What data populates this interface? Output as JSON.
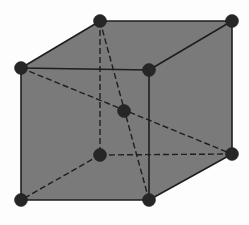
{
  "diagram": {
    "colors": {
      "fill": "#7a7a7a",
      "edge": "#1e1e1e",
      "atom": "#262626",
      "background": "#fdfdfd"
    },
    "atom_radius": 6.5,
    "vertices": {
      "top_back_left": {
        "x": 100,
        "y": 21
      },
      "top_back_right": {
        "x": 232,
        "y": 21
      },
      "top_front_left": {
        "x": 21,
        "y": 68
      },
      "top_front_right": {
        "x": 149,
        "y": 70
      },
      "bottom_back_left": {
        "x": 100,
        "y": 155
      },
      "bottom_back_right": {
        "x": 232,
        "y": 154
      },
      "bottom_front_left": {
        "x": 21,
        "y": 200
      },
      "bottom_front_right": {
        "x": 149,
        "y": 200
      },
      "body_center": {
        "x": 124,
        "y": 111
      }
    },
    "visible_edges": [
      [
        "top_front_left",
        "top_back_left"
      ],
      [
        "top_back_left",
        "top_back_right"
      ],
      [
        "top_back_right",
        "top_front_right"
      ],
      [
        "top_front_right",
        "top_front_left"
      ],
      [
        "top_front_left",
        "bottom_front_left"
      ],
      [
        "top_front_right",
        "bottom_front_right"
      ],
      [
        "top_back_right",
        "bottom_back_right"
      ],
      [
        "bottom_front_left",
        "bottom_front_right"
      ],
      [
        "bottom_front_right",
        "bottom_back_right"
      ]
    ],
    "hidden_edges": [
      [
        "top_back_left",
        "bottom_back_left"
      ],
      [
        "bottom_back_left",
        "bottom_back_right"
      ],
      [
        "bottom_back_left",
        "bottom_front_left"
      ]
    ],
    "body_diagonals": [
      [
        "top_back_left",
        "bottom_front_right"
      ],
      [
        "top_front_left",
        "bottom_back_right"
      ]
    ]
  }
}
